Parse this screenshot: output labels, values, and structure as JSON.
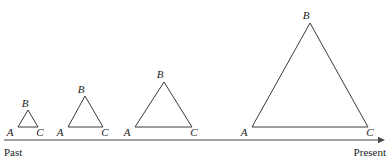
{
  "figure": {
    "type": "diagram",
    "baseline_y": 127,
    "vertex_labels": {
      "left": "A",
      "apex": "B",
      "right": "C"
    },
    "triangles": [
      {
        "index": 1,
        "left_x": 18,
        "right_x": 38,
        "apex_x": 28,
        "base_y": 127,
        "apex_y": 110,
        "label_a": "A",
        "label_b": "B",
        "label_c": "C",
        "label_a_x": 10,
        "label_a_y": 136,
        "label_b_x": 25,
        "label_b_y": 107,
        "label_c_x": 40,
        "label_c_y": 136
      },
      {
        "index": 2,
        "left_x": 68,
        "right_x": 103,
        "apex_x": 85,
        "base_y": 127,
        "apex_y": 96,
        "label_a": "A",
        "label_b": "B",
        "label_c": "C",
        "label_a_x": 60,
        "label_a_y": 136,
        "label_b_x": 81,
        "label_b_y": 93,
        "label_c_x": 105,
        "label_c_y": 136
      },
      {
        "index": 3,
        "left_x": 135,
        "right_x": 192,
        "apex_x": 164,
        "base_y": 127,
        "apex_y": 82,
        "label_a": "A",
        "label_b": "B",
        "label_c": "C",
        "label_a_x": 127,
        "label_a_y": 136,
        "label_b_x": 160,
        "label_b_y": 78,
        "label_c_x": 194,
        "label_c_y": 136
      },
      {
        "index": 4,
        "left_x": 252,
        "right_x": 368,
        "apex_x": 310,
        "base_y": 127,
        "apex_y": 23,
        "label_a": "A",
        "label_b": "B",
        "label_c": "C",
        "label_a_x": 244,
        "label_a_y": 136,
        "label_b_x": 306,
        "label_b_y": 19,
        "label_c_x": 370,
        "label_c_y": 136
      }
    ],
    "time_axis": {
      "y": 140,
      "x_start": 4,
      "x_end": 382,
      "arrowhead": "right",
      "left_label": "Past",
      "right_label": "Present",
      "left_label_x": 4,
      "left_label_y": 156,
      "right_label_x": 386,
      "right_label_y": 156
    },
    "colors": {
      "stroke": "#3a3a3a",
      "axis": "#4a4a4a",
      "text": "#1a1a1a",
      "background": "#ffffff"
    }
  }
}
